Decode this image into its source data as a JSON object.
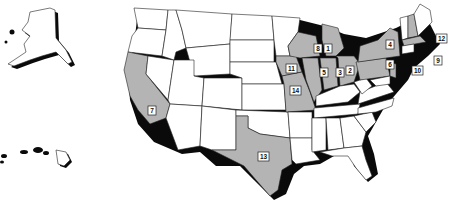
{
  "map": {
    "title": "United States",
    "colors": {
      "highlight": "#b4b4b4",
      "plain": "#ffffff",
      "shadow": "#0a0a0a",
      "outline": "#222222"
    },
    "highlighted_states": [
      {
        "state": "Michigan",
        "label": "1"
      },
      {
        "state": "Ohio",
        "label": "2"
      },
      {
        "state": "Indiana",
        "label": "3"
      },
      {
        "state": "New York",
        "label": "4"
      },
      {
        "state": "Illinois",
        "label": "5"
      },
      {
        "state": "Pennsylvania",
        "label": "6"
      },
      {
        "state": "California",
        "label": "7"
      },
      {
        "state": "Wisconsin",
        "label": "8"
      },
      {
        "state": "Massachusetts",
        "label": "9"
      },
      {
        "state": "New Jersey",
        "label": "10"
      },
      {
        "state": "Iowa",
        "label": "11"
      },
      {
        "state": "New Hampshire",
        "label": "12"
      },
      {
        "state": "Texas",
        "label": "13"
      },
      {
        "state": "Missouri",
        "label": "14"
      }
    ],
    "insets": [
      "Alaska",
      "Hawaii"
    ]
  }
}
